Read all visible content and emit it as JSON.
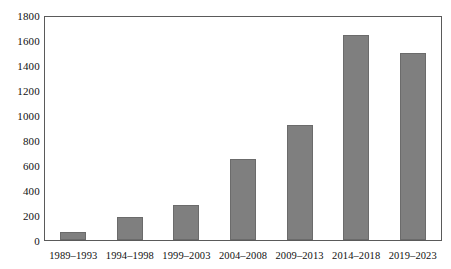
{
  "chart_data": {
    "type": "bar",
    "title": "",
    "subtitle": "",
    "xlabel": "",
    "ylabel": "",
    "categories": [
      "1989–1993",
      "1994–1998",
      "1999–2003",
      "2004–2008",
      "2009–2013",
      "2014–2018",
      "2019–2023"
    ],
    "values": [
      65,
      185,
      280,
      650,
      930,
      1655,
      1510
    ],
    "ylim": [
      0,
      1800
    ],
    "y_ticks": [
      0,
      200,
      400,
      600,
      800,
      1000,
      1200,
      1400,
      1600,
      1800
    ],
    "y_tick_labels": [
      "0",
      "200",
      "400",
      "600",
      "800",
      "1000",
      "1200",
      "1400",
      "1600",
      "1800"
    ],
    "grid": false,
    "legend": null,
    "bar_color": "#7f7f7f",
    "bar_edge_color": "#6b6b6b",
    "frame_color": "#5a5a5a",
    "background_color": "#ffffff"
  }
}
